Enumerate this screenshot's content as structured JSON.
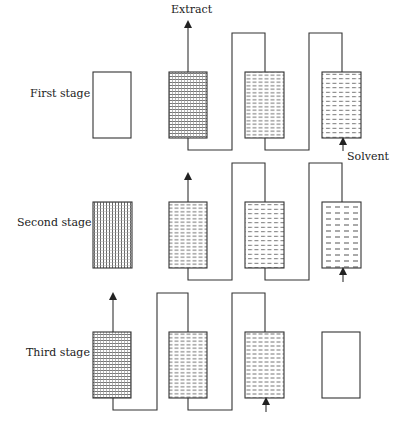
{
  "diagram": {
    "type": "countercurrent multi-stage extraction",
    "labels": {
      "extract": "Extract",
      "solvent": "Solvent"
    },
    "stages": [
      {
        "label": "First stage",
        "columns": [
          "empty",
          "very-dense",
          "dense",
          "medium"
        ]
      },
      {
        "label": "Second stage",
        "columns": [
          "vertical-grid",
          "dense",
          "medium",
          "sparse"
        ]
      },
      {
        "label": "Third stage",
        "columns": [
          "very-dense",
          "dense",
          "dense-dashed",
          "empty"
        ]
      }
    ],
    "colors": {
      "line": "#333333",
      "hatch": "#555555",
      "background": "#ffffff"
    }
  }
}
